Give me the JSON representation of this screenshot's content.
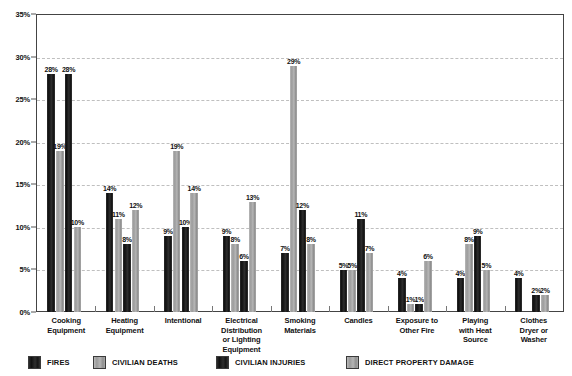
{
  "chart_data": {
    "type": "bar",
    "title": "",
    "subtitle": "",
    "xlabel": "",
    "ylabel": "",
    "ylim": [
      0,
      35
    ],
    "ytick_values": [
      0,
      5,
      10,
      15,
      20,
      25,
      30,
      35
    ],
    "ytick_labels": [
      "0%",
      "5%",
      "10%",
      "15%",
      "20%",
      "25%",
      "30%",
      "35%"
    ],
    "grid": true,
    "grid_style": "dashed-horizontal",
    "legend_position": "bottom",
    "value_labels": true,
    "value_label_suffix": "%",
    "categories": [
      "Cooking Equipment",
      "Heating Equipment",
      "Intentional",
      "Electrical Distribution or Lighting Equipment",
      "Smoking Materials",
      "Candles",
      "Exposure to Other Fire",
      "Playing with Heat Source",
      "Clothes Dryer or Washer"
    ],
    "category_lines": [
      [
        "Cooking",
        "Equipment"
      ],
      [
        "Heating",
        "Equipment"
      ],
      [
        "Intentional"
      ],
      [
        "Electrical",
        "Distribution",
        "or Lighting",
        "Equipment"
      ],
      [
        "Smoking",
        "Materials"
      ],
      [
        "Candles"
      ],
      [
        "Exposure to",
        "Other Fire"
      ],
      [
        "Playing",
        "with Heat",
        "Source"
      ],
      [
        "Clothes",
        "Dryer or",
        "Washer"
      ]
    ],
    "series": [
      {
        "name": "FIRES",
        "color": "#161616",
        "values": [
          28,
          14,
          9,
          9,
          7,
          5,
          4,
          4,
          4
        ],
        "labels": [
          "28%",
          "14%",
          "9%",
          "9%",
          "7%",
          "5%",
          "4%",
          "4%",
          "4%"
        ]
      },
      {
        "name": "CIVILIAN DEATHS",
        "color": "#a3a3a3",
        "values": [
          19,
          11,
          19,
          8,
          29,
          5,
          1,
          8,
          0
        ],
        "labels": [
          "19%",
          "11%",
          "19%",
          "8%",
          "29%",
          "5%",
          "1%",
          "8%",
          ""
        ]
      },
      {
        "name": "CIVILIAN INJURIES",
        "color": "#161616",
        "values": [
          28,
          8,
          10,
          6,
          12,
          11,
          1,
          9,
          2
        ],
        "labels": [
          "28%",
          "8%",
          "10%",
          "6%",
          "12%",
          "11%",
          "1%",
          "9%",
          "2%"
        ]
      },
      {
        "name": "DIRECT PROPERTY DAMAGE",
        "color": "#a3a3a3",
        "values": [
          10,
          12,
          14,
          13,
          8,
          7,
          6,
          5,
          2
        ],
        "labels": [
          "10%",
          "12%",
          "14%",
          "13%",
          "8%",
          "7%",
          "6%",
          "5%",
          "2%"
        ]
      }
    ]
  },
  "legend": {
    "items": [
      {
        "label": "FIRES",
        "swatch": "#161616"
      },
      {
        "label": "CIVILIAN DEATHS",
        "swatch": "#a3a3a3"
      },
      {
        "label": "CIVILIAN INJURIES",
        "swatch": "#161616"
      },
      {
        "label": "DIRECT PROPERTY DAMAGE",
        "swatch": "#a3a3a3"
      }
    ]
  }
}
